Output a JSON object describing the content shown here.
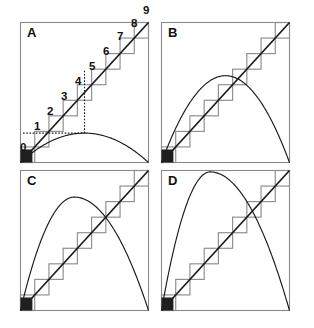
{
  "figure": {
    "background_color": "#ffffff",
    "width": 314,
    "height": 328,
    "colors": {
      "frame_stroke": "#8a8a8a",
      "grid_box_stroke": "#8d8d8d",
      "diagonal_stroke": "#1a1a1a",
      "parabola_stroke": "#1a1a1a",
      "origin_block_fill": "#1f1f1f",
      "label_fill": "#101010"
    }
  },
  "panels": [
    {
      "id": "A",
      "label": "A",
      "label_x": 27,
      "label_y": 37,
      "frame": {
        "x": 20.5,
        "y": 22.5,
        "w": 128,
        "h": 140
      },
      "parabola_peak_fraction": 0.21,
      "has_step_labels": true,
      "has_guides": true,
      "step_labels": [
        {
          "text": "0",
          "x": 20,
          "y": 151
        },
        {
          "text": "1",
          "x": 34,
          "y": 130
        },
        {
          "text": "2",
          "x": 47,
          "y": 115
        },
        {
          "text": "3",
          "x": 61,
          "y": 100
        },
        {
          "text": "4",
          "x": 75,
          "y": 85
        },
        {
          "text": "5",
          "x": 89,
          "y": 70
        },
        {
          "text": "6",
          "x": 103,
          "y": 55
        },
        {
          "text": "7",
          "x": 117,
          "y": 40
        },
        {
          "text": "8",
          "x": 131,
          "y": 27
        },
        {
          "text": "9",
          "x": 143,
          "y": 14
        }
      ]
    },
    {
      "id": "B",
      "label": "B",
      "label_x": 168,
      "label_y": 37,
      "frame": {
        "x": 161.5,
        "y": 22.5,
        "w": 128,
        "h": 140
      },
      "parabola_peak_fraction": 0.62,
      "has_step_labels": false,
      "has_guides": false,
      "step_labels": []
    },
    {
      "id": "C",
      "label": "C",
      "label_x": 27,
      "label_y": 185,
      "frame": {
        "x": 20.5,
        "y": 170.5,
        "w": 128,
        "h": 140
      },
      "parabola_peak_fraction": 0.81,
      "has_step_labels": false,
      "has_guides": false,
      "step_labels": []
    },
    {
      "id": "D",
      "label": "D",
      "label_x": 168,
      "label_y": 185,
      "frame": {
        "x": 161.5,
        "y": 170.5,
        "w": 128,
        "h": 140
      },
      "parabola_peak_fraction": 0.99,
      "has_step_labels": false,
      "has_guides": false,
      "step_labels": []
    }
  ],
  "chart_data": {
    "type": "line",
    "xlabel": "",
    "ylabel": "",
    "xlim": [
      0,
      1
    ],
    "ylim": [
      0,
      1
    ],
    "grid": false,
    "legend": null,
    "shared_elements": {
      "diagonal": {
        "name": "identity line y = x",
        "from": [
          0,
          0
        ],
        "to": [
          1,
          1
        ]
      },
      "staircase_boxes": {
        "name": "cobweb staircase squares",
        "count": 9,
        "box_size_fraction": 0.111,
        "description": "nine equal squares tiled along the diagonal from origin to top-right corner"
      },
      "origin_block": {
        "name": "filled seed square at origin",
        "size_fraction": 0.093
      }
    },
    "series": [
      {
        "name": "A",
        "panel": "A",
        "curve": "parabola",
        "peak_height": 0.21,
        "peak_x": 0.5,
        "endpoints": [
          [
            0,
            0
          ],
          [
            1,
            0
          ]
        ]
      },
      {
        "name": "B",
        "panel": "B",
        "curve": "parabola",
        "peak_height": 0.62,
        "peak_x": 0.5,
        "endpoints": [
          [
            0,
            0
          ],
          [
            1,
            0
          ]
        ]
      },
      {
        "name": "C",
        "panel": "C",
        "curve": "parabola",
        "peak_height": 0.81,
        "peak_x": 0.42,
        "endpoints": [
          [
            0,
            0
          ],
          [
            1,
            0
          ]
        ]
      },
      {
        "name": "D",
        "panel": "D",
        "curve": "parabola",
        "peak_height": 0.99,
        "peak_x": 0.38,
        "endpoints": [
          [
            0,
            0
          ],
          [
            1,
            0
          ]
        ]
      }
    ],
    "annotations": {
      "step_numbers": [
        "0",
        "1",
        "2",
        "3",
        "4",
        "5",
        "6",
        "7",
        "8",
        "9"
      ],
      "panel_letters": [
        "A",
        "B",
        "C",
        "D"
      ],
      "guides": [
        {
          "type": "dotted-horizontal",
          "panel": "A"
        },
        {
          "type": "dotted-vertical",
          "panel": "A"
        }
      ]
    }
  }
}
